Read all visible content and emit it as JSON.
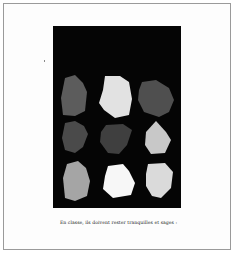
{
  "figure": {
    "background": "#050505",
    "shapes": [
      {
        "row": 1,
        "col": 1,
        "fill": "#5c5c5c",
        "points": "12,52 22,49 30,57 34,66 32,85 22,90 10,89 8,72"
      },
      {
        "row": 1,
        "col": 2,
        "fill": "#e2e2e2",
        "points": "52,50 67,50 76,56 79,73 76,89 62,92 51,84 46,77 50,64"
      },
      {
        "row": 1,
        "col": 3,
        "fill": "#4f4f4f",
        "points": "89,56 103,54 116,62 121,74 116,86 106,91 91,86 85,74 86,64"
      },
      {
        "row": 2,
        "col": 1,
        "fill": "#4a4a4a",
        "points": "12,97 22,95 31,100 35,108 30,121 22,127 12,124 9,112"
      },
      {
        "row": 2,
        "col": 2,
        "fill": "#3f3f3f",
        "points": "53,99 70,98 79,104 74,119 66,128 55,127 47,116 48,106"
      },
      {
        "row": 2,
        "col": 3,
        "fill": "#c8c8c8",
        "points": "103,95 113,106 118,114 112,127 98,128 92,119 93,106"
      },
      {
        "row": 3,
        "col": 1,
        "fill": "#a5a5a5",
        "points": "14,138 25,135 33,142 37,155 34,170 22,175 12,172 10,152"
      },
      {
        "row": 3,
        "col": 2,
        "fill": "#f7f7f7",
        "points": "55,140 70,138 76,145 82,157 78,169 60,172 50,163 52,150"
      },
      {
        "row": 3,
        "col": 3,
        "fill": "#dadada",
        "points": "95,138 112,137 120,146 118,162 108,172 99,170 93,160 93,148"
      }
    ]
  },
  "caption": "En classe, ils doivent rester tranquilles et sages :"
}
